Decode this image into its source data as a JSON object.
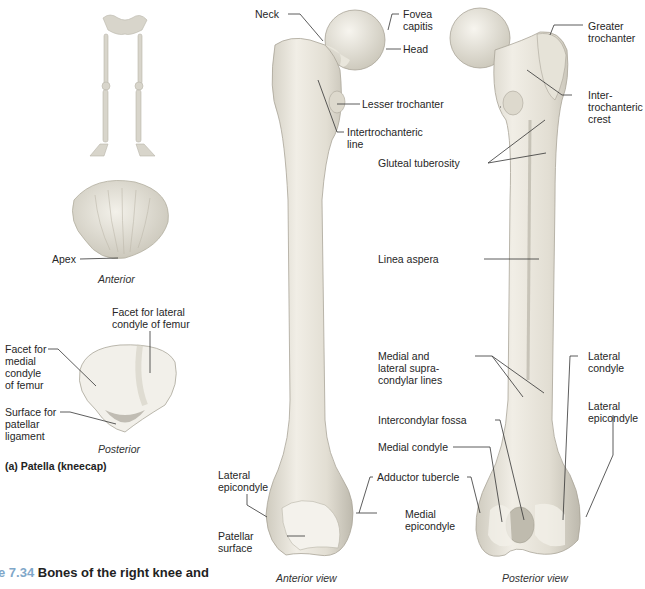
{
  "figure": {
    "number": "e 7.34",
    "title": "Bones of the right knee and",
    "subfigure_a": "(a) Patella (kneecap)"
  },
  "patella": {
    "anterior_caption": "Anterior",
    "posterior_caption": "Posterior",
    "labels": {
      "apex": "Apex",
      "facet_lateral": "Facet for lateral\ncondyle of femur",
      "facet_medial": "Facet for\nmedial\ncondyle\nof femur",
      "surface_ligament": "Surface for\npatellar\nligament"
    }
  },
  "femur": {
    "anterior_caption": "Anterior view",
    "posterior_caption": "Posterior view",
    "labels": {
      "neck": "Neck",
      "fovea_capitis": "Fovea\ncapitis",
      "head": "Head",
      "greater_trochanter": "Greater\ntrochanter",
      "intertrochanteric_crest": "Inter-\ntrochanteric\ncrest",
      "lesser_trochanter": "Lesser trochanter",
      "intertrochanteric_line": "Intertrochanteric\nline",
      "gluteal_tuberosity": "Gluteal tuberosity",
      "linea_aspera": "Linea aspera",
      "supracondylar_lines": "Medial and\nlateral supra-\ncondylar lines",
      "lateral_condyle": "Lateral\ncondyle",
      "lateral_epicondyle_post": "Lateral\nepicondyle",
      "intercondylar_fossa": "Intercondylar fossa",
      "medial_condyle": "Medial condyle",
      "adductor_tubercle": "Adductor tubercle",
      "medial_epicondyle": "Medial\nepicondyle",
      "lateral_epicondyle_ant": "Lateral\nepicondyle",
      "patellar_surface": "Patellar\nsurface"
    }
  },
  "colors": {
    "bone": "#ece9df",
    "bone_shade": "#c9c5b8",
    "leader_line": "#333333",
    "figure_number": "#7fa7c9"
  }
}
